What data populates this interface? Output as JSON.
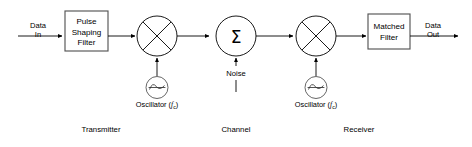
{
  "diagram": {
    "accent_color": "#000000",
    "box_stroke_color": "#555555",
    "background_color": "#ffffff"
  },
  "signals": {
    "input_line1": "Data",
    "input_line2": "In",
    "output_line1": "Data",
    "output_line2": "Out",
    "noise": "Noise"
  },
  "blocks": {
    "pulse_shaping_filter": {
      "line1": "Pulse",
      "line2": "Shaping",
      "line3": "Filter"
    },
    "matched_filter": {
      "line1": "Matched",
      "line2": "Filter"
    },
    "summer": {
      "glyph": "Σ",
      "name": "summation-node"
    },
    "mixer_tx": {
      "name": "mixer-multiplier"
    },
    "mixer_rx": {
      "name": "mixer-multiplier"
    }
  },
  "oscillators": {
    "transmitter": {
      "label": "Oscillator (",
      "symbol": "f",
      "subscript": "c",
      "close": ")"
    },
    "receiver": {
      "label": "Oscillator (",
      "symbol": "f",
      "subscript": "c",
      "close": ")"
    }
  },
  "sections": {
    "transmitter": "Transmitter",
    "channel": "Channel",
    "receiver": "Receiver"
  }
}
